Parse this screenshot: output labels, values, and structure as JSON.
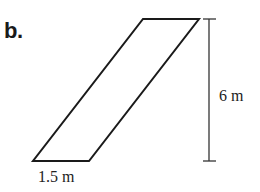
{
  "problem_label": "b.",
  "figure": {
    "shape": "parallelogram",
    "base_label": "1.5 m",
    "height_label": "6 m",
    "stroke_color": "#1a1a1a"
  }
}
